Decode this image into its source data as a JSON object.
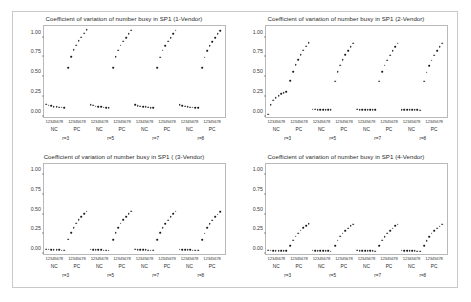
{
  "figure": {
    "background": "#ffffff",
    "frame_color": "#c9c9c9",
    "point_color": "#1a1a1a",
    "axis_color": "#b9b9b9"
  },
  "panels": [
    {
      "key": "p1",
      "title": "Coefficient of variation of number busy in SP1 (1-Vendor)"
    },
    {
      "key": "p2",
      "title": "Coefficient of variation of number busy in SP1 (2-Vendor)"
    },
    {
      "key": "p3",
      "title": "Coefficient of variation of number busy in SP1 ( (3-Vendor)"
    },
    {
      "key": "p4",
      "title": "Coefficient of variation of number busy in SP1 (4-Vendor)"
    }
  ],
  "axis": {
    "ytick_labels": [
      "1.00",
      "0.75",
      "0.50",
      "0.25",
      "0.00"
    ],
    "ytick_values": [
      1.0,
      0.75,
      0.5,
      0.25,
      0.0
    ],
    "ylim": [
      0.0,
      1.15
    ],
    "xtick_group_label": "12345678",
    "xgroup_labels": [
      "NC",
      "PC",
      "NC",
      "PC",
      "NC",
      "PC",
      "NC",
      "PC"
    ],
    "xsuper_labels": [
      "r=3",
      "r=5",
      "r=7",
      "r=8"
    ],
    "points_per_group": 8,
    "n_groups": 8
  },
  "chart_data": [
    {
      "type": "scatter",
      "panel": "1-Vendor",
      "title": "Coefficient of variation of number busy in SP1 (1-Vendor)",
      "xlabel": "",
      "ylabel": "",
      "ylim": [
        0.0,
        1.15
      ],
      "grid": false,
      "legend": "none",
      "x": [
        1,
        2,
        3,
        4,
        5,
        6,
        7,
        8
      ],
      "series": [
        {
          "name": "r=3 NC",
          "values": [
            0.155,
            0.142,
            0.133,
            0.127,
            0.122,
            0.118,
            0.115,
            0.112
          ]
        },
        {
          "name": "r=3 PC",
          "values": [
            0.62,
            0.76,
            0.845,
            0.905,
            0.96,
            1.005,
            1.055,
            1.1
          ]
        },
        {
          "name": "r=5 NC",
          "values": [
            0.152,
            0.14,
            0.132,
            0.126,
            0.121,
            0.117,
            0.114,
            0.111
          ]
        },
        {
          "name": "r=5 PC",
          "values": [
            0.62,
            0.757,
            0.843,
            0.903,
            0.958,
            1.003,
            1.053,
            1.098
          ]
        },
        {
          "name": "r=7 NC",
          "values": [
            0.15,
            0.139,
            0.131,
            0.125,
            0.12,
            0.116,
            0.113,
            0.11
          ]
        },
        {
          "name": "r=7 PC",
          "values": [
            0.618,
            0.755,
            0.84,
            0.9,
            0.955,
            1.0,
            1.05,
            1.095
          ]
        },
        {
          "name": "r=8 NC",
          "values": [
            0.149,
            0.138,
            0.13,
            0.124,
            0.119,
            0.115,
            0.112,
            0.109
          ]
        },
        {
          "name": "r=8 PC",
          "values": [
            0.617,
            0.753,
            0.838,
            0.898,
            0.953,
            0.998,
            1.048,
            1.093
          ]
        }
      ]
    },
    {
      "type": "scatter",
      "panel": "2-Vendor",
      "title": "Coefficient of variation of number busy in SP1 (2-Vendor)",
      "xlabel": "",
      "ylabel": "",
      "ylim": [
        0.0,
        1.15
      ],
      "grid": false,
      "legend": "none",
      "x": [
        1,
        2,
        3,
        4,
        5,
        6,
        7,
        8
      ],
      "series": [
        {
          "name": "r=3 NC",
          "values": [
            0.03,
            0.15,
            0.205,
            0.24,
            0.265,
            0.285,
            0.3,
            0.312
          ]
        },
        {
          "name": "r=3 PC",
          "values": [
            0.455,
            0.57,
            0.655,
            0.72,
            0.785,
            0.84,
            0.89,
            0.935
          ]
        },
        {
          "name": "r=5 NC",
          "values": [
            0.092,
            0.09,
            0.089,
            0.088,
            0.087,
            0.086,
            0.085,
            0.084
          ]
        },
        {
          "name": "r=5 PC",
          "values": [
            0.45,
            0.568,
            0.652,
            0.718,
            0.782,
            0.838,
            0.888,
            0.932
          ]
        },
        {
          "name": "r=7 NC",
          "values": [
            0.09,
            0.088,
            0.087,
            0.086,
            0.085,
            0.084,
            0.083,
            0.082
          ]
        },
        {
          "name": "r=7 PC",
          "values": [
            0.448,
            0.565,
            0.65,
            0.715,
            0.78,
            0.835,
            0.885,
            0.93
          ]
        },
        {
          "name": "r=8 NC",
          "values": [
            0.089,
            0.087,
            0.086,
            0.085,
            0.084,
            0.083,
            0.082,
            0.081
          ]
        },
        {
          "name": "r=8 PC",
          "values": [
            0.446,
            0.563,
            0.648,
            0.713,
            0.778,
            0.833,
            0.883,
            0.928
          ]
        }
      ]
    },
    {
      "type": "scatter",
      "panel": "3-Vendor",
      "title": "Coefficient of variation of number busy in SP1 ( (3-Vendor)",
      "xlabel": "",
      "ylabel": "",
      "ylim": [
        0.0,
        1.15
      ],
      "grid": false,
      "legend": "none",
      "x": [
        1,
        2,
        3,
        4,
        5,
        6,
        7,
        8
      ],
      "series": [
        {
          "name": "r=3 NC",
          "values": [
            0.062,
            0.058,
            0.055,
            0.053,
            0.051,
            0.05,
            0.049,
            0.048
          ]
        },
        {
          "name": "r=3 PC",
          "values": [
            0.185,
            0.27,
            0.335,
            0.39,
            0.435,
            0.475,
            0.512,
            0.545
          ]
        },
        {
          "name": "r=5 NC",
          "values": [
            0.06,
            0.057,
            0.054,
            0.052,
            0.05,
            0.049,
            0.048,
            0.047
          ]
        },
        {
          "name": "r=5 PC",
          "values": [
            0.183,
            0.268,
            0.333,
            0.388,
            0.433,
            0.473,
            0.51,
            0.543
          ]
        },
        {
          "name": "r=7 NC",
          "values": [
            0.059,
            0.056,
            0.054,
            0.052,
            0.05,
            0.049,
            0.048,
            0.047
          ]
        },
        {
          "name": "r=7 PC",
          "values": [
            0.182,
            0.266,
            0.331,
            0.386,
            0.431,
            0.471,
            0.508,
            0.541
          ]
        },
        {
          "name": "r=8 NC",
          "values": [
            0.058,
            0.056,
            0.053,
            0.051,
            0.05,
            0.048,
            0.047,
            0.046
          ]
        },
        {
          "name": "r=8 PC",
          "values": [
            0.181,
            0.265,
            0.33,
            0.385,
            0.43,
            0.47,
            0.507,
            0.54
          ]
        }
      ]
    },
    {
      "type": "scatter",
      "panel": "4-Vendor",
      "title": "Coefficient of variation of number busy in SP1 (4-Vendor)",
      "xlabel": "",
      "ylabel": "",
      "ylim": [
        0.0,
        1.15
      ],
      "grid": false,
      "legend": "none",
      "x": [
        1,
        2,
        3,
        4,
        5,
        6,
        7,
        8
      ],
      "series": [
        {
          "name": "r=3 NC",
          "values": [
            0.048,
            0.045,
            0.043,
            0.042,
            0.041,
            0.04,
            0.039,
            0.038
          ]
        },
        {
          "name": "r=3 PC",
          "values": [
            0.108,
            0.175,
            0.225,
            0.265,
            0.3,
            0.33,
            0.358,
            0.382
          ]
        },
        {
          "name": "r=5 NC",
          "values": [
            0.047,
            0.044,
            0.042,
            0.041,
            0.04,
            0.039,
            0.038,
            0.037
          ]
        },
        {
          "name": "r=5 PC",
          "values": [
            0.106,
            0.173,
            0.223,
            0.263,
            0.298,
            0.328,
            0.356,
            0.38
          ]
        },
        {
          "name": "r=7 NC",
          "values": [
            0.046,
            0.044,
            0.042,
            0.04,
            0.039,
            0.038,
            0.038,
            0.037
          ]
        },
        {
          "name": "r=7 PC",
          "values": [
            0.105,
            0.172,
            0.222,
            0.262,
            0.297,
            0.327,
            0.355,
            0.379
          ]
        },
        {
          "name": "r=8 NC",
          "values": [
            0.046,
            0.043,
            0.041,
            0.04,
            0.039,
            0.038,
            0.037,
            0.036
          ]
        },
        {
          "name": "r=8 PC",
          "values": [
            0.104,
            0.171,
            0.221,
            0.261,
            0.296,
            0.326,
            0.354,
            0.378
          ]
        }
      ]
    }
  ]
}
